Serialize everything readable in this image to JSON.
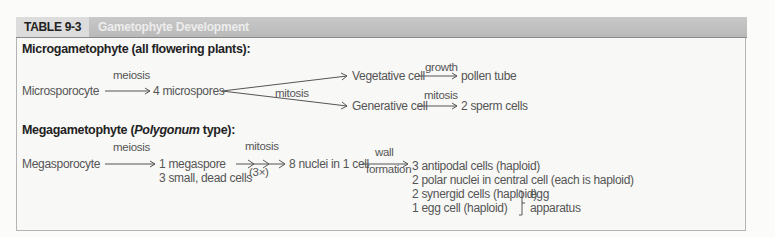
{
  "table": {
    "number": "TABLE 9-3",
    "title": "Gametophyte Development"
  },
  "micro": {
    "heading": "Microgametophyte (all flowering plants):",
    "start": "Microsporocyte",
    "step1_label": "meiosis",
    "step1_result": "4 microspores",
    "fork_label": "mitosis",
    "branch_upper": {
      "cell": "Vegetative cell",
      "arrow_label": "growth",
      "result": "pollen tube"
    },
    "branch_lower": {
      "cell": "Generative cell",
      "arrow_label": "mitosis",
      "result": "2 sperm cells"
    }
  },
  "mega": {
    "heading_pre": "Megagametophyte (",
    "heading_italic": "Polygonum",
    "heading_post": " type):",
    "start": "Megasporocyte",
    "step1_label": "meiosis",
    "step1_result_line1": "1 megaspore",
    "step1_result_line2": "3 small, dead cells",
    "step2_label": "mitosis",
    "step2_sublabel": "(3×)",
    "step2_result": "8 nuclei in 1 cell",
    "step3_label_top": "wall",
    "step3_label_bottom": "formation",
    "results": [
      "3 antipodal cells (haploid)",
      "2 polar nuclei in central cell (each is haploid)",
      "2 synergid cells (haploid)",
      "1 egg cell (haploid)"
    ],
    "bracket_label_line1": "egg",
    "bracket_label_line2": "apparatus"
  }
}
